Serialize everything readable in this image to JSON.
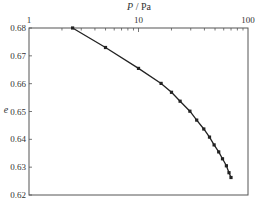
{
  "chart_data": {
    "type": "line",
    "title": "",
    "xlabel": "P / Pa",
    "xlabel_italic_part": "P",
    "xlabel_unit": "/ Pa",
    "ylabel": "e",
    "xscale": "log",
    "xlim": [
      1,
      100
    ],
    "ylim": [
      0.62,
      0.68
    ],
    "x_axis_position": "top",
    "grid": false,
    "legend": null,
    "x_ticks": [
      {
        "value": 1,
        "label": "1"
      },
      {
        "value": 10,
        "label": "10"
      },
      {
        "value": 100,
        "label": "100"
      }
    ],
    "y_ticks": [
      {
        "value": 0.68,
        "label": "0.68"
      },
      {
        "value": 0.67,
        "label": "0.67"
      },
      {
        "value": 0.66,
        "label": "0.66"
      },
      {
        "value": 0.65,
        "label": "0.65"
      },
      {
        "value": 0.64,
        "label": "0.64"
      },
      {
        "value": 0.63,
        "label": "0.63"
      },
      {
        "value": 0.62,
        "label": "0.62"
      }
    ],
    "series": [
      {
        "name": "e vs P",
        "marker": "square",
        "color": "#222222",
        "x": [
          2.5,
          5.0,
          10.0,
          16.1,
          20.0,
          24.0,
          29.5,
          34.0,
          39.5,
          44.5,
          49.0,
          54.0,
          58.5,
          63.5,
          67.0,
          70.0
        ],
        "y": [
          0.68,
          0.673,
          0.6655,
          0.6601,
          0.6569,
          0.6537,
          0.6501,
          0.6469,
          0.6437,
          0.6408,
          0.638,
          0.6355,
          0.633,
          0.6305,
          0.628,
          0.6263
        ]
      }
    ]
  },
  "colors": {
    "axis": "#555555",
    "line": "#222222",
    "text": "#333333",
    "background": "#ffffff"
  }
}
